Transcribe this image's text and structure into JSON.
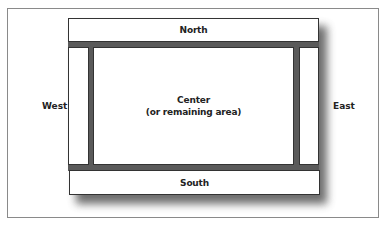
{
  "diagram": {
    "title": "",
    "regions": {
      "north": {
        "label": "North"
      },
      "south": {
        "label": "South"
      },
      "west": {
        "label": "West"
      },
      "east": {
        "label": "East"
      },
      "center": {
        "label": "Center",
        "sublabel": "(or remaining area)"
      }
    },
    "colors": {
      "frame_border": "#8a8a8a",
      "region_border": "#333333",
      "region_fill": "#ffffff",
      "shadow": "#555555",
      "text": "#222222"
    }
  }
}
